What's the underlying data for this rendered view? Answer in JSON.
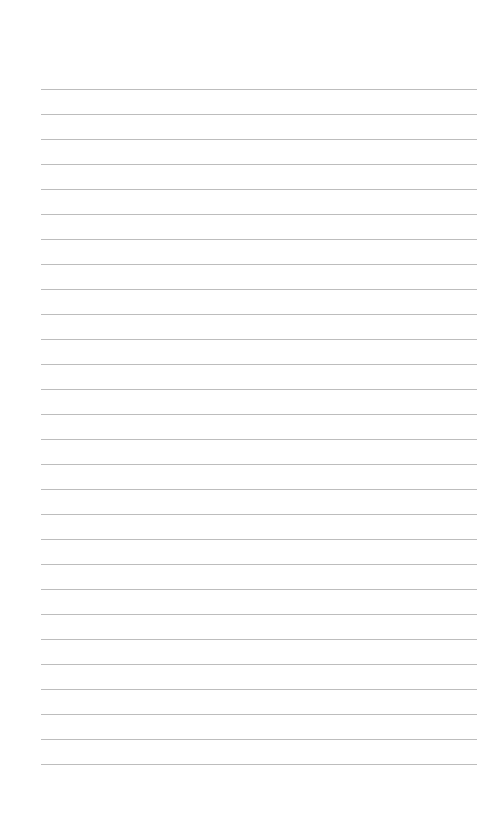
{
  "page": {
    "type": "lined-paper",
    "background": "#ffffff",
    "line_color": "#bdbdbd",
    "line_count": 28,
    "first_line_y": 89,
    "line_spacing": 25,
    "line_left": 41,
    "line_right": 477
  }
}
